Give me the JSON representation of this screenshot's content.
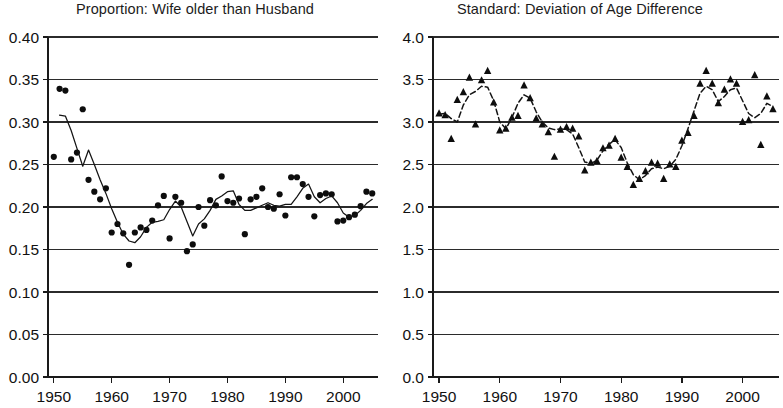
{
  "figure": {
    "background": "#ffffff",
    "ink_color": "#111111",
    "width": 775,
    "height": 408
  },
  "chart_data": [
    {
      "type": "scatter",
      "panel": "left",
      "title": "Proportion: Wife older than Husband",
      "xlabel": "",
      "ylabel": "",
      "xlim": [
        1949,
        2006
      ],
      "ylim": [
        0.0,
        0.4
      ],
      "grid": true,
      "legend": "none",
      "xticks": [
        1950,
        1960,
        1970,
        1980,
        1990,
        2000
      ],
      "xtick_labels": [
        "1950",
        "1960",
        "1970",
        "1980",
        "1990",
        "2000"
      ],
      "yticks": [
        0.0,
        0.05,
        0.1,
        0.15,
        0.2,
        0.25,
        0.3,
        0.35,
        0.4
      ],
      "ytick_labels": [
        "0.00",
        "0.05",
        "0.10",
        "0.15",
        "0.20",
        "0.25",
        "0.30",
        "0.35",
        "0.40"
      ],
      "series": [
        {
          "name": "Proportion wife older (annual observations)",
          "marker": "filled-circle",
          "style": "points",
          "x": [
            1950,
            1951,
            1952,
            1953,
            1954,
            1955,
            1956,
            1957,
            1958,
            1959,
            1960,
            1961,
            1962,
            1963,
            1964,
            1965,
            1966,
            1967,
            1968,
            1969,
            1970,
            1971,
            1972,
            1973,
            1974,
            1975,
            1976,
            1977,
            1978,
            1979,
            1980,
            1981,
            1982,
            1983,
            1984,
            1985,
            1986,
            1987,
            1988,
            1989,
            1990,
            1991,
            1992,
            1993,
            1994,
            1995,
            1996,
            1997,
            1998,
            1999,
            2000,
            2001,
            2002,
            2003,
            2004,
            2005
          ],
          "y": [
            0.259,
            0.339,
            0.337,
            0.256,
            0.264,
            0.315,
            0.232,
            0.218,
            0.209,
            0.222,
            0.17,
            0.18,
            0.169,
            0.132,
            0.17,
            0.176,
            0.173,
            0.184,
            0.202,
            0.213,
            0.163,
            0.212,
            0.205,
            0.148,
            0.156,
            0.2,
            0.178,
            0.208,
            0.202,
            0.236,
            0.207,
            0.205,
            0.21,
            0.168,
            0.209,
            0.212,
            0.222,
            0.2,
            0.198,
            0.215,
            0.19,
            0.235,
            0.235,
            0.227,
            0.212,
            0.189,
            0.214,
            0.216,
            0.215,
            0.183,
            0.184,
            0.188,
            0.191,
            0.201,
            0.218,
            0.216
          ]
        },
        {
          "name": "Smoothed trend",
          "marker": "none",
          "style": "solid-line",
          "x": [
            1951,
            1952,
            1953,
            1954,
            1955,
            1956,
            1957,
            1958,
            1959,
            1960,
            1961,
            1962,
            1963,
            1964,
            1965,
            1966,
            1967,
            1968,
            1969,
            1970,
            1971,
            1972,
            1973,
            1974,
            1975,
            1976,
            1977,
            1978,
            1979,
            1980,
            1981,
            1982,
            1983,
            1984,
            1985,
            1986,
            1987,
            1988,
            1989,
            1990,
            1991,
            1992,
            1993,
            1994,
            1995,
            1996,
            1997,
            1998,
            1999,
            2000,
            2001,
            2002,
            2003,
            2004,
            2005
          ],
          "y": [
            0.308,
            0.307,
            0.29,
            0.269,
            0.248,
            0.267,
            0.25,
            0.232,
            0.216,
            0.198,
            0.182,
            0.168,
            0.16,
            0.158,
            0.165,
            0.176,
            0.182,
            0.183,
            0.185,
            0.197,
            0.207,
            0.2,
            0.183,
            0.166,
            0.18,
            0.186,
            0.196,
            0.209,
            0.213,
            0.218,
            0.219,
            0.203,
            0.196,
            0.196,
            0.199,
            0.202,
            0.205,
            0.202,
            0.201,
            0.203,
            0.203,
            0.212,
            0.222,
            0.227,
            0.212,
            0.205,
            0.21,
            0.213,
            0.205,
            0.193,
            0.188,
            0.19,
            0.196,
            0.204,
            0.209
          ]
        }
      ]
    },
    {
      "type": "scatter",
      "panel": "right",
      "title": "Standard: Deviation of Age Difference",
      "xlabel": "",
      "ylabel": "",
      "xlim": [
        1949,
        2006
      ],
      "ylim": [
        0.0,
        4.0
      ],
      "grid": true,
      "legend": "none",
      "xticks": [
        1950,
        1960,
        1970,
        1980,
        1990,
        2000
      ],
      "xtick_labels": [
        "1950",
        "1960",
        "1970",
        "1980",
        "1990",
        "2000"
      ],
      "yticks": [
        0.0,
        0.5,
        1.0,
        1.5,
        2.0,
        2.5,
        3.0,
        3.5,
        4.0
      ],
      "ytick_labels": [
        "0.0",
        "0.5",
        "1.0",
        "1.5",
        "2.0",
        "2.5",
        "3.0",
        "3.5",
        "4.0"
      ],
      "series": [
        {
          "name": "Standard deviation of age difference (annual observations)",
          "marker": "filled-triangle",
          "style": "points",
          "x": [
            1950,
            1951,
            1952,
            1953,
            1954,
            1955,
            1956,
            1957,
            1958,
            1959,
            1960,
            1961,
            1962,
            1963,
            1964,
            1965,
            1966,
            1967,
            1968,
            1969,
            1970,
            1971,
            1972,
            1973,
            1974,
            1975,
            1976,
            1977,
            1978,
            1979,
            1980,
            1981,
            1982,
            1983,
            1984,
            1985,
            1986,
            1987,
            1988,
            1989,
            1990,
            1991,
            1992,
            1993,
            1994,
            1995,
            1996,
            1997,
            1998,
            1999,
            2000,
            2001,
            2002,
            2003,
            2004,
            2005
          ],
          "y": [
            3.1,
            3.08,
            2.8,
            3.26,
            3.35,
            3.52,
            2.97,
            3.49,
            3.6,
            3.23,
            2.9,
            2.92,
            3.05,
            3.07,
            3.43,
            3.28,
            3.04,
            2.97,
            2.88,
            2.59,
            2.91,
            2.94,
            2.92,
            2.83,
            2.43,
            2.52,
            2.54,
            2.69,
            2.72,
            2.8,
            2.58,
            2.47,
            2.26,
            2.33,
            2.42,
            2.52,
            2.51,
            2.33,
            2.5,
            2.47,
            2.78,
            2.87,
            3.07,
            3.45,
            3.6,
            3.45,
            3.22,
            3.38,
            3.5,
            3.45,
            3.0,
            3.02,
            3.55,
            2.73,
            3.3,
            3.15
          ]
        },
        {
          "name": "Smoothed trend",
          "marker": "none",
          "style": "dashed-line",
          "x": [
            1950,
            1951,
            1952,
            1953,
            1954,
            1955,
            1956,
            1957,
            1958,
            1959,
            1960,
            1961,
            1962,
            1963,
            1964,
            1965,
            1966,
            1967,
            1968,
            1969,
            1970,
            1971,
            1972,
            1973,
            1974,
            1975,
            1976,
            1977,
            1978,
            1979,
            1980,
            1981,
            1982,
            1983,
            1984,
            1985,
            1986,
            1987,
            1988,
            1989,
            1990,
            1991,
            1992,
            1993,
            1994,
            1995,
            1996,
            1997,
            1998,
            1999,
            2000,
            2001,
            2002,
            2003,
            2004,
            2005
          ],
          "y": [
            3.09,
            3.1,
            3.04,
            3.0,
            3.2,
            3.32,
            3.36,
            3.42,
            3.41,
            3.25,
            3.0,
            2.92,
            3.05,
            3.22,
            3.32,
            3.28,
            3.12,
            3.0,
            2.93,
            2.91,
            2.92,
            2.91,
            2.86,
            2.7,
            2.53,
            2.51,
            2.55,
            2.66,
            2.74,
            2.79,
            2.7,
            2.52,
            2.38,
            2.32,
            2.37,
            2.45,
            2.47,
            2.45,
            2.48,
            2.56,
            2.72,
            2.92,
            3.13,
            3.34,
            3.42,
            3.38,
            3.24,
            3.3,
            3.38,
            3.4,
            3.25,
            3.1,
            3.05,
            3.1,
            3.22,
            3.18
          ]
        }
      ]
    }
  ]
}
